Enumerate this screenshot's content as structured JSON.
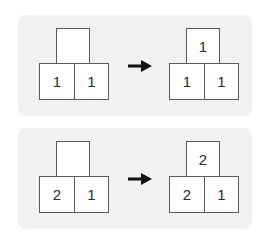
{
  "diagram": {
    "background": "#f1f1f1",
    "box_border": "#5a5a5a",
    "arrow_color": "#111111",
    "rows": [
      {
        "before": {
          "top": "",
          "bottom_left": "1",
          "bottom_right": "1"
        },
        "arrow": "right-arrow",
        "after": {
          "top": "1",
          "bottom_left": "1",
          "bottom_right": "1"
        }
      },
      {
        "before": {
          "top": "",
          "bottom_left": "2",
          "bottom_right": "1"
        },
        "arrow": "right-arrow",
        "after": {
          "top": "2",
          "bottom_left": "2",
          "bottom_right": "1"
        }
      }
    ]
  }
}
